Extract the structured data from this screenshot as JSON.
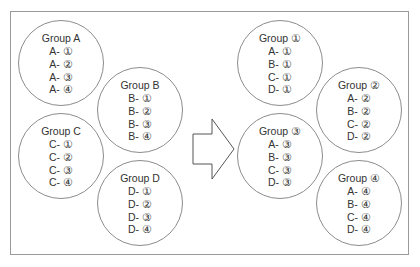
{
  "before": {
    "groups": [
      {
        "title": "Group A",
        "items": [
          "A- ①",
          "A- ②",
          "A- ③",
          "A- ④"
        ]
      },
      {
        "title": "Group B",
        "items": [
          "B- ①",
          "B- ②",
          "B- ③",
          "B- ④"
        ]
      },
      {
        "title": "Group C",
        "items": [
          "C- ①",
          "C- ②",
          "C- ③",
          "C- ④"
        ]
      },
      {
        "title": "Group D",
        "items": [
          "D- ①",
          "D- ②",
          "D- ③",
          "D- ④"
        ]
      }
    ]
  },
  "after": {
    "groups": [
      {
        "title": "Group ①",
        "items": [
          "A- ①",
          "B- ①",
          "C- ①",
          "D- ①"
        ]
      },
      {
        "title": "Group ②",
        "items": [
          "A- ②",
          "B- ②",
          "C- ②",
          "D- ②"
        ]
      },
      {
        "title": "Group ③",
        "items": [
          "A- ③",
          "B- ③",
          "C- ③",
          "D- ③"
        ]
      },
      {
        "title": "Group ④",
        "items": [
          "A- ④",
          "B- ④",
          "C- ④",
          "D- ④"
        ]
      }
    ]
  },
  "arrow": {
    "icon": "right-arrow-icon",
    "stroke": "#555555"
  },
  "colors": {
    "circle_border": "#8c8c8c",
    "frame_border": "#9a9a9a",
    "text": "#333333"
  }
}
